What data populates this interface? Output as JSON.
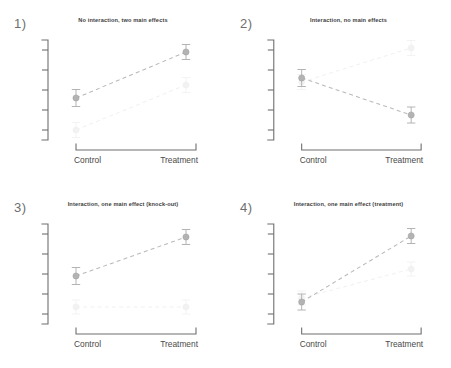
{
  "figure": {
    "background_color": "#ffffff",
    "panel_count": 4,
    "x_categories": [
      "Control",
      "Treatment"
    ],
    "colors": {
      "primary_series": "#b3b3b3",
      "secondary_series": "#f1f1f1",
      "axis": "#6f6f6f",
      "title_text": "#3d3d3d",
      "label_text": "#4a4a4a",
      "panel_number_text": "#6e6e6e"
    }
  },
  "chart_data": [
    {
      "type": "line",
      "panel_number": "1)",
      "title": "No interaction, two main effects",
      "categories": [
        "Control",
        "Treatment"
      ],
      "x": [
        0,
        1
      ],
      "xlabel": "",
      "ylabel": "",
      "ylim": [
        0,
        1
      ],
      "y_tick_count": 5,
      "y_tick_labels": [],
      "grid": false,
      "legend": "none",
      "series": [
        {
          "name": "primary",
          "values": [
            0.42,
            0.88
          ],
          "errors": [
            0.085,
            0.075
          ],
          "emphasis": "high"
        },
        {
          "name": "secondary",
          "values": [
            0.1,
            0.55
          ],
          "errors": [
            0.075,
            0.075
          ],
          "emphasis": "low"
        }
      ]
    },
    {
      "type": "line",
      "panel_number": "2)",
      "title": "Interaction, no main effects",
      "categories": [
        "Control",
        "Treatment"
      ],
      "x": [
        0,
        1
      ],
      "xlabel": "",
      "ylabel": "",
      "ylim": [
        0,
        1
      ],
      "y_tick_count": 5,
      "y_tick_labels": [],
      "grid": false,
      "legend": "none",
      "series": [
        {
          "name": "primary",
          "values": [
            0.62,
            0.25
          ],
          "errors": [
            0.085,
            0.08
          ],
          "emphasis": "high"
        },
        {
          "name": "secondary",
          "values": [
            0.58,
            0.92
          ],
          "errors": [
            0.075,
            0.075
          ],
          "emphasis": "low"
        }
      ]
    },
    {
      "type": "line",
      "panel_number": "3)",
      "title": "Interaction, one main effect (knock-out)",
      "categories": [
        "Control",
        "Treatment"
      ],
      "x": [
        0,
        1
      ],
      "xlabel": "",
      "ylabel": "",
      "ylim": [
        0,
        1
      ],
      "y_tick_count": 5,
      "y_tick_labels": [],
      "grid": false,
      "legend": "none",
      "series": [
        {
          "name": "primary",
          "values": [
            0.48,
            0.87
          ],
          "errors": [
            0.085,
            0.075
          ],
          "emphasis": "high"
        },
        {
          "name": "secondary",
          "values": [
            0.17,
            0.17
          ],
          "errors": [
            0.07,
            0.07
          ],
          "emphasis": "low"
        }
      ]
    },
    {
      "type": "line",
      "panel_number": "4)",
      "title": "Interaction, one main effect (treatment)",
      "categories": [
        "Control",
        "Treatment"
      ],
      "x": [
        0,
        1
      ],
      "xlabel": "",
      "ylabel": "",
      "ylim": [
        0,
        1
      ],
      "y_tick_count": 5,
      "y_tick_labels": [],
      "grid": false,
      "legend": "none",
      "series": [
        {
          "name": "primary",
          "values": [
            0.22,
            0.88
          ],
          "errors": [
            0.08,
            0.075
          ],
          "emphasis": "high"
        },
        {
          "name": "secondary",
          "values": [
            0.26,
            0.55
          ],
          "errors": [
            0.07,
            0.07
          ],
          "emphasis": "low"
        }
      ]
    }
  ]
}
